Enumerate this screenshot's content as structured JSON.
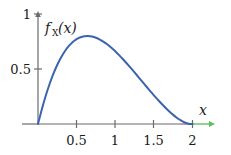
{
  "chart_data": {
    "type": "line",
    "title": "",
    "subtitle": "",
    "xlabel": "x",
    "ylabel": "f_X(x)",
    "ylabel_parts": {
      "base": "f",
      "subscript": "X",
      "argument": "(x)"
    },
    "xlim": [
      0,
      2.25
    ],
    "ylim": [
      0,
      1
    ],
    "grid": false,
    "legend": null,
    "x_ticks": [
      {
        "value": 0.5,
        "label": "0.5"
      },
      {
        "value": 1,
        "label": "1"
      },
      {
        "value": 1.5,
        "label": "1.5"
      },
      {
        "value": 2,
        "label": "2"
      }
    ],
    "y_ticks": [
      {
        "value": 0.5,
        "label": "0.5"
      },
      {
        "value": 1,
        "label": "1"
      }
    ],
    "series": [
      {
        "name": "f_X(x)",
        "color": "#3b64ad",
        "x": [
          0.0,
          0.05,
          0.1,
          0.15,
          0.2,
          0.25,
          0.3,
          0.35,
          0.4,
          0.45,
          0.5,
          0.55,
          0.6,
          0.65,
          0.7,
          0.75,
          0.8,
          0.85,
          0.9,
          0.95,
          1.0,
          1.05,
          1.1,
          1.15,
          1.2,
          1.25,
          1.3,
          1.35,
          1.4,
          1.45,
          1.5,
          1.55,
          1.6,
          1.65,
          1.7,
          1.75,
          1.8,
          1.85,
          1.9,
          1.95,
          2.0
        ],
        "y": [
          0.0,
          0.135,
          0.257,
          0.364,
          0.458,
          0.539,
          0.607,
          0.664,
          0.71,
          0.746,
          0.772,
          0.789,
          0.798,
          0.8,
          0.795,
          0.784,
          0.768,
          0.747,
          0.722,
          0.693,
          0.661,
          0.626,
          0.589,
          0.55,
          0.51,
          0.469,
          0.427,
          0.385,
          0.343,
          0.302,
          0.261,
          0.222,
          0.184,
          0.148,
          0.114,
          0.083,
          0.055,
          0.032,
          0.014,
          0.003,
          0.0
        ],
        "peak": {
          "x": 0.8,
          "y": 0.8
        }
      }
    ],
    "axis_segments": [
      {
        "name": "x-axis-main",
        "from": 0,
        "to": 2,
        "color": "#6b6b6b"
      },
      {
        "name": "x-axis-support-highlight",
        "from": 1.85,
        "to": 2.0,
        "color": "#9b4f8f"
      },
      {
        "name": "x-axis-tail",
        "from": 2.0,
        "to": 2.22,
        "color": "#5fbf60"
      }
    ],
    "colors": {
      "curve": "#3b64ad",
      "axis": "#6b6b6b",
      "tail": "#5fbf60",
      "highlight": "#9b4f8f",
      "text": "#1a1a1a",
      "background": "#ffffff"
    }
  }
}
